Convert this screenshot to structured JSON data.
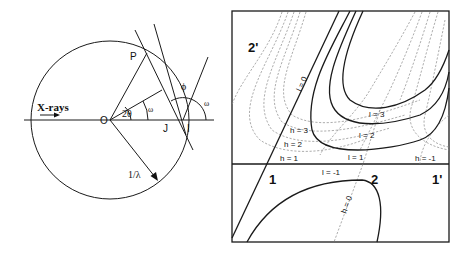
{
  "left_diagram": {
    "title": "Ewald sphere construction",
    "labels": {
      "incident": "X-rays",
      "origin": "O",
      "point_p": "P",
      "point_i": "I",
      "point_j": "J",
      "two_theta": "2θ",
      "omega_inner": "ω",
      "omega_outer": "ω",
      "phi": "ϕ",
      "radius": "1/λ"
    }
  },
  "right_diagram": {
    "title": "Reciprocal lattice curves",
    "region_labels": {
      "top_left": "2'",
      "bottom_left": "1",
      "bottom_mid": "2",
      "bottom_right": "1'"
    },
    "curve_labels": {
      "l0": "l = 0",
      "l3": "l = 3",
      "l2": "l = 2",
      "l1": "l = 1",
      "lm1": "l = -1",
      "h3": "h = 3",
      "h2": "h = 2",
      "h1": "h = 1",
      "hm1": "h = -1",
      "h0": "h = 0"
    }
  }
}
